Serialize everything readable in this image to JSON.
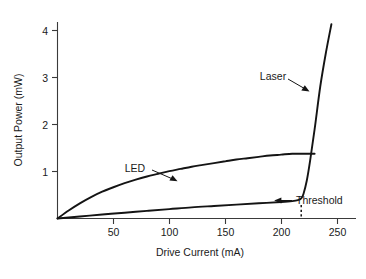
{
  "chart_data": {
    "type": "line",
    "title": "",
    "xlabel": "Drive Current (mA)",
    "ylabel": "Output Power (mW)",
    "xlim": [
      0,
      267
    ],
    "ylim": [
      0,
      4.4
    ],
    "xticks": [
      50,
      100,
      150,
      200,
      250
    ],
    "xtick_labels": [
      "50",
      "100",
      "150",
      "200",
      "250"
    ],
    "yticks": [
      1,
      2,
      3,
      4
    ],
    "ytick_labels": [
      "1",
      "2",
      "3",
      "4"
    ],
    "grid": false,
    "legend": "none",
    "series": [
      {
        "name": "LED",
        "label": "LED",
        "description": "Sub-linear saturating curve rising from origin to a plateau near 1.45 mW",
        "x": [
          0,
          10,
          20,
          30,
          40,
          50,
          60,
          70,
          80,
          90,
          100,
          110,
          120,
          130,
          140,
          150,
          160,
          170,
          180,
          190,
          200,
          210,
          220,
          230
        ],
        "y": [
          0.0,
          0.18,
          0.34,
          0.48,
          0.6,
          0.7,
          0.79,
          0.87,
          0.94,
          1.0,
          1.06,
          1.11,
          1.16,
          1.2,
          1.24,
          1.28,
          1.32,
          1.35,
          1.38,
          1.41,
          1.43,
          1.45,
          1.45,
          1.45
        ]
      },
      {
        "name": "Laser",
        "label": "Laser",
        "description": "Weak spontaneous emission below threshold then steep linear lasing slope above threshold",
        "x": [
          0,
          20,
          40,
          60,
          80,
          100,
          120,
          140,
          160,
          180,
          200,
          210,
          215,
          218,
          220,
          223,
          226,
          230,
          235,
          240,
          245
        ],
        "y": [
          0.0,
          0.045,
          0.09,
          0.13,
          0.17,
          0.21,
          0.25,
          0.28,
          0.31,
          0.34,
          0.37,
          0.39,
          0.41,
          0.45,
          0.55,
          0.85,
          1.3,
          2.0,
          2.95,
          3.7,
          4.35
        ]
      }
    ],
    "annotations": [
      {
        "name": "led-label",
        "text": "LED",
        "x": 110,
        "y": 1.35,
        "points_to": [
          145,
          1.25
        ]
      },
      {
        "name": "laser-label",
        "text": "Laser",
        "x": 200,
        "y": 3.25,
        "points_to": [
          232,
          2.9
        ]
      },
      {
        "name": "threshold-label",
        "text": "Threshold",
        "x": 232,
        "y": 0.52,
        "points_to": [
          219,
          0.48
        ]
      }
    ],
    "threshold": {
      "label": "Threshold",
      "current_ma": 218,
      "dash_from_y": 0.0,
      "dash_to_y": 0.3
    }
  }
}
